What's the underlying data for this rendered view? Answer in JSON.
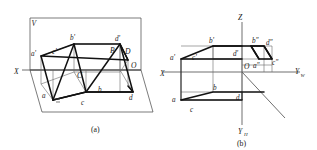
{
  "figure": {
    "background_color": "#ffffff",
    "line_color": "#111111",
    "thin_line_color": "#6a6a6a",
    "axis_color": "#555555"
  },
  "panel_a": {
    "caption": "(a)",
    "description": "Pictorial view: wedge solid between V plane and H plane",
    "plane_labels": {
      "v_plane": "V",
      "origin": "O",
      "x_axis": "X"
    },
    "vertex_labels": {
      "front_a": "a'",
      "front_b": "b'",
      "front_c": "c'",
      "front_d": "d'",
      "top_a": "a",
      "top_b": "b",
      "top_c": "c",
      "top_d": "d",
      "space_b": "B",
      "space_c": "C",
      "space_d": "D"
    }
  },
  "panel_b": {
    "caption": "(b)",
    "description": "Unfolded three-view projection layout",
    "axis_labels": {
      "z": "Z",
      "x": "X",
      "y_w": "Y",
      "y_w_sub": "W",
      "y_h": "Y",
      "y_h_sub": "H",
      "origin": "O"
    },
    "front_view_labels": {
      "a": "a'",
      "b": "b'",
      "c": "c'",
      "d": "d'"
    },
    "top_view_labels": {
      "a": "a",
      "b": "b",
      "c": "c",
      "d": "d"
    },
    "side_view_labels": {
      "a": "a\"",
      "b": "b\"",
      "c": "c\"",
      "d": "d\""
    }
  }
}
